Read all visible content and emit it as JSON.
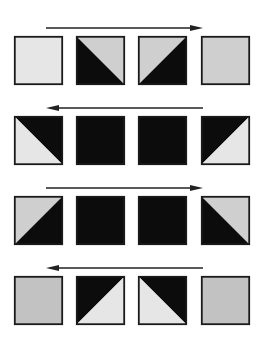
{
  "colors": {
    "black": "#0c0c0c",
    "very_light": "#e6e6e6",
    "light": "#cfcfcf",
    "mid": "#c2c2c2",
    "arrow": "#222222",
    "border": "#1a1a1a"
  },
  "layout": {
    "square_size": 49,
    "columns_x": [
      14,
      76,
      138,
      201
    ]
  },
  "rows": [
    {
      "id": "row-1",
      "arrow": {
        "direction": "right",
        "y": 28,
        "x1": 46,
        "x2": 203
      },
      "square_top": 36,
      "squares": [
        {
          "type": "solid",
          "fill": "very_light"
        },
        {
          "type": "diagonal",
          "diagonal": "tl-br",
          "lower": "black",
          "upper": "light"
        },
        {
          "type": "diagonal",
          "diagonal": "tr-bl",
          "upper": "light",
          "lower": "black"
        },
        {
          "type": "solid",
          "fill": "light"
        }
      ]
    },
    {
      "id": "row-2",
      "arrow": {
        "direction": "left",
        "y": 108,
        "x1": 46,
        "x2": 203
      },
      "square_top": 116,
      "squares": [
        {
          "type": "diagonal",
          "diagonal": "tl-br",
          "lower": "very_light",
          "upper": "black"
        },
        {
          "type": "solid",
          "fill": "black"
        },
        {
          "type": "solid",
          "fill": "black"
        },
        {
          "type": "diagonal",
          "diagonal": "tr-bl",
          "upper": "black",
          "lower": "very_light"
        }
      ]
    },
    {
      "id": "row-3",
      "arrow": {
        "direction": "right",
        "y": 188,
        "x1": 46,
        "x2": 203
      },
      "square_top": 196,
      "squares": [
        {
          "type": "diagonal",
          "diagonal": "tr-bl",
          "upper": "light",
          "lower": "black"
        },
        {
          "type": "solid",
          "fill": "black"
        },
        {
          "type": "solid",
          "fill": "black"
        },
        {
          "type": "diagonal",
          "diagonal": "tl-br",
          "lower": "black",
          "upper": "light"
        }
      ]
    },
    {
      "id": "row-4",
      "arrow": {
        "direction": "left",
        "y": 268,
        "x1": 46,
        "x2": 203
      },
      "square_top": 276,
      "squares": [
        {
          "type": "solid",
          "fill": "mid"
        },
        {
          "type": "diagonal",
          "diagonal": "tr-bl",
          "upper": "black",
          "lower": "very_light"
        },
        {
          "type": "diagonal",
          "diagonal": "tl-br",
          "lower": "very_light",
          "upper": "black"
        },
        {
          "type": "solid",
          "fill": "mid"
        }
      ]
    }
  ]
}
